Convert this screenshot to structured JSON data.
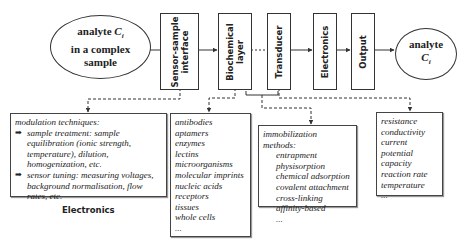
{
  "nodes": {
    "input_ellipse": {
      "line1": "analyte ",
      "symbol": "C",
      "sub": "i",
      "line2": "in a complex",
      "line3": "sample"
    },
    "blocks": [
      {
        "id": "sensor-sample-interface",
        "label_line1": "Sensor-sample",
        "label_line2": "interface"
      },
      {
        "id": "biochemical-layer",
        "label_line1": "Biochemical",
        "label_line2": "layer"
      },
      {
        "id": "transducer",
        "label_line1": "Transducer",
        "label_line2": ""
      },
      {
        "id": "electronics",
        "label_line1": "Electronics",
        "label_line2": ""
      },
      {
        "id": "output",
        "label_line1": "Output",
        "label_line2": ""
      }
    ],
    "output_ellipse": {
      "line1": "analyte",
      "symbol": "C",
      "sub": "i"
    }
  },
  "notes": {
    "modulation": {
      "title": "modulation techniques:",
      "bullets": [
        "sample treatment: sample equilibration (ionic strength, temperature), dilution, homogenization, etc.",
        "sensor tuning: measuring voltages, background normalisation, flow rates, etc."
      ],
      "bullet_glyph": "➡",
      "caption": "Electronics"
    },
    "biorecognition": {
      "items": [
        "antibodies",
        "aptamers",
        "enzymes",
        "lectins",
        "microorganisms",
        "molecular imprints",
        "nucleic acids",
        "receptors",
        "tissues",
        "whole cells",
        "..."
      ]
    },
    "immobilization": {
      "title": "immobilization methods:",
      "items": [
        "entrapment",
        "physisorption",
        "chemical adsorption",
        "covalent attachment",
        "cross-linking",
        "affinity-based",
        "..."
      ]
    },
    "properties": {
      "items": [
        "resistance",
        "conductivity",
        "current",
        "potential",
        "capacity",
        "reaction rate",
        "temperature",
        "..."
      ]
    }
  },
  "colors": {
    "line": "#333333",
    "background": "#ffffff",
    "text": "#222222"
  }
}
